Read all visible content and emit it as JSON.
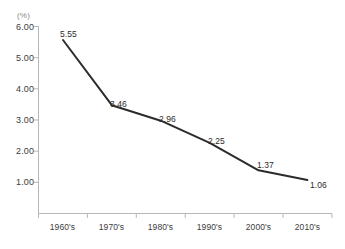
{
  "chart_data": {
    "type": "line",
    "title": "",
    "subtitle": "",
    "xlabel": "",
    "ylabel": "(%)",
    "unit_label": "(%)",
    "categories": [
      "1960's",
      "1970's",
      "1980's",
      "1990's",
      "2000's",
      "2010's"
    ],
    "values": [
      5.55,
      3.46,
      2.96,
      2.25,
      1.37,
      1.06
    ],
    "series": [
      {
        "name": "",
        "values": [
          5.55,
          3.46,
          2.96,
          2.25,
          1.37,
          1.06
        ]
      }
    ],
    "point_labels": [
      "5.55",
      "3.46",
      "2.96",
      "2.25",
      "1.37",
      "1.06"
    ],
    "ylim": [
      0.0,
      6.0
    ],
    "yticks": [
      6.0,
      5.0,
      4.0,
      3.0,
      2.0,
      1.0
    ],
    "ytick_labels": [
      "6.00",
      "5.00",
      "4.00",
      "3.00",
      "2.00",
      "1.00"
    ],
    "grid": false,
    "legend": false,
    "legend_position": "none",
    "line_color": "#2b2b2b",
    "axis_color": "#b7b7b7",
    "background_color": "#ffffff",
    "markers": false
  },
  "axes": {
    "y_unit": "(%)",
    "y_tick_labels": [
      "6.00",
      "5.00",
      "4.00",
      "3.00",
      "2.00",
      "1.00"
    ],
    "x_tick_labels": [
      "1960's",
      "1970's",
      "1980's",
      "1990's",
      "2000's",
      "2010's"
    ]
  }
}
